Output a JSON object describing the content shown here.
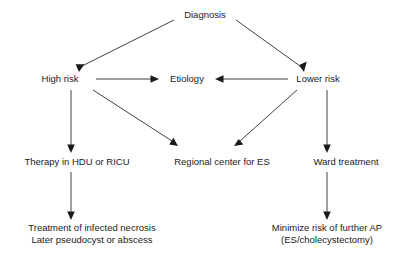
{
  "diagram": {
    "background_color": "#ffffff",
    "text_color": "#1a1a1a",
    "line_color": "#2b2b2b",
    "nodes": [
      {
        "id": "diagnosis",
        "label": "Diagnosis",
        "x": 205,
        "y": 18
      },
      {
        "id": "high_risk",
        "label": "High risk",
        "x": 60,
        "y": 82
      },
      {
        "id": "etiology",
        "label": "Etiology",
        "x": 187,
        "y": 82
      },
      {
        "id": "lower_risk",
        "label": "Lower risk",
        "x": 318,
        "y": 82
      },
      {
        "id": "therapy_hdu",
        "label": "Therapy in HDU or RICU",
        "x": 77,
        "y": 165
      },
      {
        "id": "regional_center",
        "label": "Regional center for ES",
        "x": 222,
        "y": 165
      },
      {
        "id": "ward_treatment",
        "label": "Ward treatment",
        "x": 346,
        "y": 165
      },
      {
        "id": "necrosis_line1",
        "label": "Treatment of infected necrosis",
        "x": 92,
        "y": 231
      },
      {
        "id": "necrosis_line2",
        "label": "Later pseudocyst or abscess",
        "x": 92,
        "y": 243
      },
      {
        "id": "minimize_line1",
        "label": "Minimize risk of further AP",
        "x": 327,
        "y": 231
      },
      {
        "id": "minimize_line2",
        "label": "(ES/cholecystectomy)",
        "x": 327,
        "y": 243
      }
    ],
    "edges": [
      {
        "id": "diagnosis-to-high-risk",
        "from": "diagnosis",
        "to": "high_risk",
        "kind": "diagonal"
      },
      {
        "id": "diagnosis-to-lower-risk",
        "from": "diagnosis",
        "to": "lower_risk",
        "kind": "diagonal"
      },
      {
        "id": "high-risk-to-etiology",
        "from": "high_risk",
        "to": "etiology",
        "kind": "horizontal"
      },
      {
        "id": "lower-risk-to-etiology",
        "from": "lower_risk",
        "to": "etiology",
        "kind": "horizontal"
      },
      {
        "id": "high-risk-to-therapy",
        "from": "high_risk",
        "to": "therapy_hdu",
        "kind": "vertical"
      },
      {
        "id": "high-risk-to-regional-center",
        "from": "high_risk",
        "to": "regional_center",
        "kind": "diagonal"
      },
      {
        "id": "lower-risk-to-regional-center",
        "from": "lower_risk",
        "to": "regional_center",
        "kind": "diagonal"
      },
      {
        "id": "lower-risk-to-ward",
        "from": "lower_risk",
        "to": "ward_treatment",
        "kind": "vertical"
      },
      {
        "id": "therapy-to-necrosis",
        "from": "therapy_hdu",
        "to": "necrosis_line1",
        "kind": "vertical"
      },
      {
        "id": "ward-to-minimize",
        "from": "ward_treatment",
        "to": "minimize_line1",
        "kind": "vertical"
      }
    ]
  }
}
